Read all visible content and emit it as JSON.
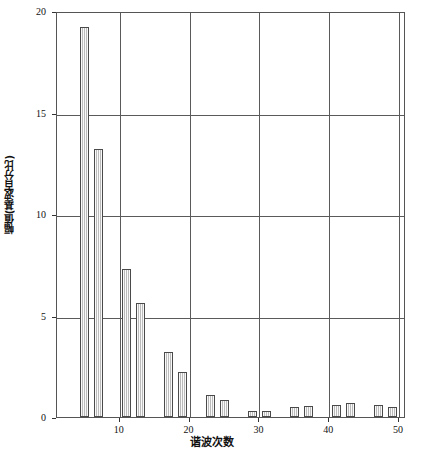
{
  "chart_data": {
    "type": "bar",
    "title": "",
    "subtitle": "",
    "xlabel": "谐波次数",
    "ylabel": "幅值(基波百分比)",
    "xlim": [
      1,
      51
    ],
    "ylim": [
      0,
      20
    ],
    "grid": true,
    "legend": null,
    "x_ticks": [
      10,
      20,
      30,
      40,
      50
    ],
    "x_tick_labels": [
      "10",
      "20",
      "30",
      "40",
      "50"
    ],
    "y_ticks": [
      0,
      5,
      10,
      15,
      20
    ],
    "y_tick_labels": [
      "0",
      "5",
      "10",
      "15",
      "20"
    ],
    "bar_fill": "#d9d9d9",
    "bar_edge": "#4a4a4a",
    "grid_color": "#5a5a5a",
    "x": [
      5,
      7,
      11,
      13,
      17,
      19,
      23,
      25,
      29,
      31,
      35,
      37,
      41,
      43,
      47,
      49
    ],
    "values": [
      19.2,
      13.2,
      7.3,
      5.6,
      3.2,
      2.2,
      1.1,
      0.85,
      0.3,
      0.3,
      0.5,
      0.55,
      0.6,
      0.7,
      0.6,
      0.5
    ],
    "points": [
      {
        "harmonic": 5,
        "amplitude": 19.2
      },
      {
        "harmonic": 7,
        "amplitude": 13.2
      },
      {
        "harmonic": 11,
        "amplitude": 7.3
      },
      {
        "harmonic": 13,
        "amplitude": 5.6
      },
      {
        "harmonic": 17,
        "amplitude": 3.2
      },
      {
        "harmonic": 19,
        "amplitude": 2.2
      },
      {
        "harmonic": 23,
        "amplitude": 1.1
      },
      {
        "harmonic": 25,
        "amplitude": 0.85
      },
      {
        "harmonic": 29,
        "amplitude": 0.3
      },
      {
        "harmonic": 31,
        "amplitude": 0.3
      },
      {
        "harmonic": 35,
        "amplitude": 0.5
      },
      {
        "harmonic": 37,
        "amplitude": 0.55
      },
      {
        "harmonic": 41,
        "amplitude": 0.6
      },
      {
        "harmonic": 43,
        "amplitude": 0.7
      },
      {
        "harmonic": 47,
        "amplitude": 0.6
      },
      {
        "harmonic": 49,
        "amplitude": 0.5
      }
    ]
  }
}
